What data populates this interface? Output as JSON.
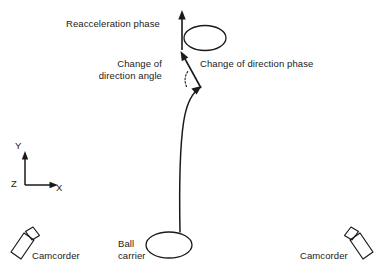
{
  "figure": {
    "background_color": "#ffffff",
    "stroke_color": "#1a1a1a"
  },
  "labels": {
    "reacceleration_phase": "Reacceleration phase",
    "change_of_direction_angle_line1": "Change of",
    "change_of_direction_angle_line2": "direction angle",
    "change_of_direction_phase": "Change of direction phase",
    "ball_carrier_line1": "Ball",
    "ball_carrier_line2": "carrier",
    "camcorder_left": "Camcorder",
    "camcorder_right": "Camcorder"
  },
  "axes": {
    "y_label": "Y",
    "x_label": "X",
    "z_label": "Z"
  },
  "icons": {
    "camcorder_left": "camcorder-icon",
    "camcorder_right": "camcorder-icon",
    "ball_carrier": "ellipse-player-icon",
    "defender": "ellipse-player-icon",
    "running_path": "curved-path-arrow-icon",
    "reacceleration_arrow": "up-arrow-icon",
    "direction_change_arrow": "diagonal-arrow-icon",
    "angle_marker": "dotted-arc-icon"
  }
}
